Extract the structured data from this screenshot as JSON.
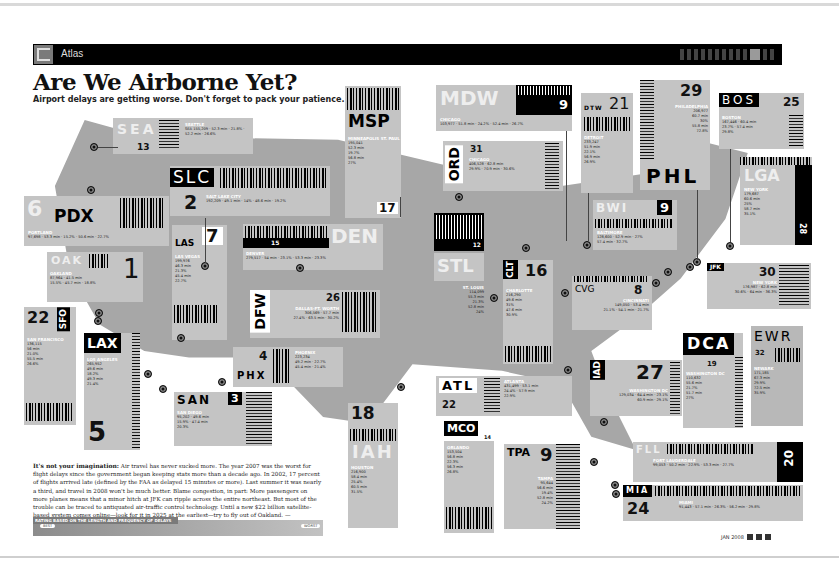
{
  "header": {
    "section": "Atlas",
    "logo_icon": "wired-logo-icon"
  },
  "title": "Are We Airborne Yet?",
  "subtitle": "Airport delays are getting worse. Don't forget to pack your patience.",
  "airports": [
    {
      "code": "SEA",
      "rank": "13",
      "city": "SEATTLE",
      "stats": [
        [
          "DEPARTURES",
          "155,209"
        ],
        [
          "AVG DEPARTURE DELAY",
          "52.3 min"
        ],
        [
          "DEPARTURES DELAYED",
          "21.8%"
        ],
        [
          "AVG ARRIVAL DELAY",
          "52.2 min"
        ],
        [
          "ARRIVALS DELAYED",
          "26.6%"
        ]
      ]
    },
    {
      "code": "PDX",
      "rank": "6",
      "city": "PORTLAND",
      "stats": [
        [
          "DEPARTURES",
          "97,698"
        ],
        [
          "AVG DEPARTURE DELAY",
          "53.3 min"
        ],
        [
          "DEPARTURES DELAYED",
          "15.2%"
        ],
        [
          "AVG ARRIVAL DELAY",
          "50.6 min"
        ],
        [
          "ARRIVALS DELAYED",
          "22.7%"
        ]
      ]
    },
    {
      "code": "SLC",
      "rank": "2",
      "city": "SALT LAKE CITY",
      "stats": [
        [
          "DEPARTURES",
          "192,209"
        ],
        [
          "AVG DEPARTURE DELAY",
          "49.1 min"
        ],
        [
          "DEPARTURES DELAYED",
          "14%"
        ],
        [
          "AVG ARRIVAL DELAY",
          "48.6 min"
        ],
        [
          "ARRIVALS DELAYED",
          "19.2%"
        ]
      ]
    },
    {
      "code": "MSP",
      "rank": "17",
      "city": "MINNEAPOLIS ST. PAUL",
      "stats": [
        [
          "DEPARTURES",
          "195,041"
        ],
        [
          "AVG DEPARTURE DELAY",
          "52.3 min"
        ],
        [
          "DEPARTURES DELAYED",
          "19.7%"
        ],
        [
          "AVG ARRIVAL DELAY",
          "56.8 min"
        ],
        [
          "ARRIVALS DELAYED",
          "27%"
        ]
      ]
    },
    {
      "code": "MDW",
      "rank": "9",
      "city": "CHICAGO",
      "stats": [
        [
          "DEPARTURES",
          "103,977"
        ],
        [
          "AVG DEPARTURE DELAY",
          "51.8 min"
        ],
        [
          "DEPARTURES DELAYED",
          "24.2%"
        ],
        [
          "AVG ARRIVAL DELAY",
          "52.4 min"
        ],
        [
          "ARRIVALS DELAYED",
          "26.7%"
        ]
      ]
    },
    {
      "code": "ORD",
      "rank": "31",
      "city": "CHICAGO",
      "stats": [
        [
          "DEPARTURES",
          "406,528"
        ],
        [
          "AVG DEPARTURE DELAY",
          "62.8 min"
        ],
        [
          "DEPARTURES DELAYED",
          "29.9%"
        ],
        [
          "AVG ARRIVAL DELAY",
          "70.9 min"
        ],
        [
          "ARRIVALS DELAYED",
          "30.6%"
        ]
      ]
    },
    {
      "code": "DTW",
      "rank": "21",
      "city": "DETROIT",
      "stats": [
        [
          "DEPARTURES",
          "233,247"
        ],
        [
          "AVG DEPARTURE DELAY",
          "51.9 min"
        ],
        [
          "DEPARTURES DELAYED",
          "22.1%"
        ],
        [
          "AVG ARRIVAL DELAY",
          "56.9 min"
        ],
        [
          "ARRIVALS DELAYED",
          "26.9%"
        ]
      ]
    },
    {
      "code": "PHL",
      "rank": "29",
      "city": "PHILADELPHIA",
      "stats": [
        [
          "DEPARTURES",
          "206,977"
        ],
        [
          "AVG DEPARTURE DELAY",
          "60.7 min"
        ],
        [
          "DEPARTURES DELAYED",
          "30%"
        ],
        [
          "AVG ARRIVAL DELAY",
          "55.8 min"
        ],
        [
          "ARRIVALS DELAYED",
          "72.8%"
        ]
      ]
    },
    {
      "code": "BOS",
      "rank": "25",
      "city": "BOSTON",
      "stats": [
        [
          "DEPARTURES",
          "167,446"
        ],
        [
          "AVG DEPARTURE DELAY",
          "60.4 min"
        ],
        [
          "DEPARTURES DELAYED",
          "23.7%"
        ],
        [
          "AVG ARRIVAL DELAY",
          "57.4 min"
        ],
        [
          "ARRIVALS DELAYED",
          "29.8%"
        ]
      ]
    },
    {
      "code": "LGA",
      "rank": "28",
      "city": "NEW YORK",
      "stats": [
        [
          "DEPARTURES",
          "179,687"
        ],
        [
          "AVG DEPARTURE DELAY",
          "60.6 min"
        ],
        [
          "DEPARTURES DELAYED",
          "25%"
        ],
        [
          "AVG ARRIVAL DELAY",
          "58.7 min"
        ],
        [
          "ARRIVALS DELAYED",
          "35.1%"
        ]
      ]
    },
    {
      "code": "JFK",
      "rank": "30",
      "city": "NEW YORK",
      "stats": [
        [
          "DEPARTURES",
          "176,987"
        ],
        [
          "AVG DEPARTURE DELAY",
          "62.8 min"
        ],
        [
          "DEPARTURES DELAYED",
          "30.6%"
        ],
        [
          "AVG ARRIVAL DELAY",
          "64 min"
        ],
        [
          "ARRIVALS DELAYED",
          "36.3%"
        ]
      ]
    },
    {
      "code": "EWR",
      "rank": "32",
      "city": "NEWARK",
      "stats": [
        [
          "DEPARTURES",
          "171,185"
        ],
        [
          "AVG DEPARTURE DELAY",
          "67.3 min"
        ],
        [
          "DEPARTURES DELAYED",
          "29.9%"
        ],
        [
          "AVG ARRIVAL DELAY",
          "72.5 min"
        ],
        [
          "ARRIVALS DELAYED",
          "35.9%"
        ]
      ]
    },
    {
      "code": "BWI",
      "rank": "9",
      "city": "BALTIMORE",
      "stats": [
        [
          "DEPARTURES",
          "128,600"
        ],
        [
          "AVG DEPARTURE DELAY",
          "52.9 min"
        ],
        [
          "DEPARTURES DELAYED",
          "27%"
        ],
        [
          "AVG ARRIVAL DELAY",
          "57.4 min"
        ],
        [
          "ARRIVALS DELAYED",
          "32.7%"
        ]
      ]
    },
    {
      "code": "DCA",
      "rank": "19",
      "city": "WASHINGTON DC",
      "stats": [
        [
          "DEPARTURES",
          "110,632"
        ],
        [
          "AVG DEPARTURE DELAY",
          "55.6 min"
        ],
        [
          "DEPARTURES DELAYED",
          "21.7%"
        ],
        [
          "AVG ARRIVAL DELAY",
          "51.7 min"
        ],
        [
          "ARRIVALS DELAYED",
          "27%"
        ]
      ]
    },
    {
      "code": "IAD",
      "rank": "27",
      "city": "WASHINGTON DC",
      "stats": [
        [
          "DEPARTURES",
          "129,034"
        ],
        [
          "AVG DEPARTURE DELAY",
          "64.4 min"
        ],
        [
          "DEPARTURES DELAYED",
          "23.1%"
        ],
        [
          "AVG ARRIVAL DELAY",
          "60.9 min"
        ],
        [
          "ARRIVALS DELAYED",
          "29.1%"
        ]
      ]
    },
    {
      "code": "CVG",
      "rank": "8",
      "city": "CINCINNATI",
      "stats": [
        [
          "DEPARTURES",
          "149,050"
        ],
        [
          "AVG DEPARTURE DELAY",
          "53.4 min"
        ],
        [
          "DEPARTURES DELAYED",
          "21.1%"
        ],
        [
          "AVG ARRIVAL DELAY",
          "54.1 min"
        ],
        [
          "ARRIVALS DELAYED",
          "21.7%"
        ]
      ]
    },
    {
      "code": "CLT",
      "rank": "16",
      "city": "CHARLOTTE",
      "stats": [
        [
          "DEPARTURES",
          "216,290"
        ],
        [
          "AVG DEPARTURE DELAY",
          "49.6 min"
        ],
        [
          "DEPARTURES DELAYED",
          "31%"
        ],
        [
          "AVG ARRIVAL DELAY",
          "47.6 min"
        ],
        [
          "ARRIVALS DELAYED",
          "30.9%"
        ]
      ]
    },
    {
      "code": "STL",
      "rank": "12",
      "city": "ST. LOUIS",
      "stats": [
        [
          "DEPARTURES",
          "114,099"
        ],
        [
          "AVG DEPARTURE DELAY",
          "55.3 min"
        ],
        [
          "DEPARTURES DELAYED",
          "21.3%"
        ],
        [
          "AVG ARRIVAL DELAY",
          "52.8 min"
        ],
        [
          "ARRIVALS DELAYED",
          "24%"
        ]
      ]
    },
    {
      "code": "DEN",
      "rank": "15",
      "city": "DENVER",
      "stats": [
        [
          "DEPARTURES",
          "279,517"
        ],
        [
          "AVG DEPARTURE DELAY",
          "54 min"
        ],
        [
          "DEPARTURES DELAYED",
          "23.1%"
        ],
        [
          "AVG ARRIVAL DELAY",
          "53.3 min"
        ],
        [
          "ARRIVALS DELAYED",
          "23.3%"
        ]
      ]
    },
    {
      "code": "LAS",
      "rank": "7",
      "city": "LAS VEGAS",
      "stats": [
        [
          "DEPARTURES",
          "199,976"
        ],
        [
          "AVG DEPARTURE DELAY",
          "46.3 min"
        ],
        [
          "DEPARTURES DELAYED",
          "21.3%"
        ],
        [
          "AVG ARRIVAL DELAY",
          "45.4 min"
        ],
        [
          "ARRIVALS DELAYED",
          "22.7%"
        ]
      ]
    },
    {
      "code": "OAK",
      "rank": "1",
      "city": "OAKLAND",
      "stats": [
        [
          "DEPARTURES",
          "87,964"
        ],
        [
          "AVG DEPARTURE DELAY",
          "41.5 min"
        ],
        [
          "DEPARTURES DELAYED",
          "15.5%"
        ],
        [
          "AVG ARRIVAL DELAY",
          "45.7 min"
        ],
        [
          "ARRIVALS DELAYED",
          "18.8%"
        ]
      ]
    },
    {
      "code": "SFO",
      "rank": "22",
      "city": "SAN FRANCISCO",
      "stats": [
        [
          "DEPARTURES",
          "136,115"
        ],
        [
          "AVG DEPARTURE DELAY",
          "56 min"
        ],
        [
          "DEPARTURES DELAYED",
          "21.0%"
        ],
        [
          "AVG ARRIVAL DELAY",
          "55.5 min"
        ],
        [
          "ARRIVALS DELAYED",
          "26.6%"
        ]
      ]
    },
    {
      "code": "LAX",
      "rank": "5",
      "city": "LOS ANGELES",
      "stats": [
        [
          "DEPARTURES",
          "265,952"
        ],
        [
          "AVG DEPARTURE DELAY",
          "49.6 min"
        ],
        [
          "DEPARTURES DELAYED",
          "18.2%"
        ],
        [
          "AVG ARRIVAL DELAY",
          "49.3 min"
        ],
        [
          "ARRIVALS DELAYED",
          "21.4%"
        ]
      ]
    },
    {
      "code": "SAN",
      "rank": "3",
      "city": "SAN DIEGO",
      "stats": [
        [
          "DEPARTURES",
          "95,202"
        ],
        [
          "AVG DEPARTURE DELAY",
          "49.6 min"
        ],
        [
          "DEPARTURES DELAYED",
          "15.9%"
        ],
        [
          "AVG ARRIVAL DELAY",
          "47.4 min"
        ],
        [
          "ARRIVALS DELAYED",
          "20.3%"
        ]
      ]
    },
    {
      "code": "PHX",
      "rank": "4",
      "city": "PHOENIX",
      "stats": [
        [
          "DEPARTURES",
          "223,234"
        ],
        [
          "AVG DEPARTURE DELAY",
          "49.2 min"
        ],
        [
          "DEPARTURES DELAYED",
          "22.7%"
        ],
        [
          "AVG ARRIVAL DELAY",
          "45.4 min"
        ],
        [
          "ARRIVALS DELAYED",
          "21.4%"
        ]
      ]
    },
    {
      "code": "DFW",
      "rank": "26",
      "city": "DALLAS-FT. WORTH",
      "stats": [
        [
          "DEPARTURES",
          "306,569"
        ],
        [
          "AVG DEPARTURE DELAY",
          "57.7 min"
        ],
        [
          "DEPARTURES DELAYED",
          "27.4%"
        ],
        [
          "AVG ARRIVAL DELAY",
          "63.5 min"
        ],
        [
          "ARRIVALS DELAYED",
          "30.2%"
        ]
      ]
    },
    {
      "code": "IAH",
      "rank": "18",
      "city": "HOUSTON",
      "stats": [
        [
          "DEPARTURES",
          "216,900"
        ],
        [
          "AVG DEPARTURE DELAY",
          "58.4 min"
        ],
        [
          "DEPARTURES DELAYED",
          "25.4%"
        ],
        [
          "AVG ARRIVAL DELAY",
          "60.5 min"
        ],
        [
          "ARRIVALS DELAYED",
          "31.5%"
        ]
      ]
    },
    {
      "code": "ATL",
      "rank": "22",
      "city": "ATLANTA",
      "stats": [
        [
          "DEPARTURES",
          "431,499"
        ],
        [
          "AVG DEPARTURE DELAY",
          "53.1 min"
        ],
        [
          "DEPARTURES DELAYED",
          "24.4%"
        ],
        [
          "AVG ARRIVAL DELAY",
          "57.9 min"
        ],
        [
          "ARRIVALS DELAYED",
          "22.9%"
        ]
      ]
    },
    {
      "code": "MCO",
      "rank": "14",
      "city": "ORLANDO",
      "stats": [
        [
          "DEPARTURES",
          "153,504"
        ],
        [
          "AVG DEPARTURE DELAY",
          "56.8 min"
        ],
        [
          "DEPARTURES DELAYED",
          "22.3%"
        ],
        [
          "AVG ARRIVAL DELAY",
          "56.3 min"
        ],
        [
          "ARRIVALS DELAYED",
          "26.8%"
        ]
      ]
    },
    {
      "code": "TPA",
      "rank": "9",
      "city": "TAMPA",
      "stats": [
        [
          "DEPARTURES",
          "95,644"
        ],
        [
          "AVG DEPARTURE DELAY",
          "56.6 min"
        ],
        [
          "DEPARTURES DELAYED",
          "19.4%"
        ],
        [
          "AVG ARRIVAL DELAY",
          "52.8 min"
        ],
        [
          "ARRIVALS DELAYED",
          "24.2%"
        ]
      ]
    },
    {
      "code": "FLL",
      "rank": "20",
      "city": "FORT LAUDERDALE",
      "stats": [
        [
          "DEPARTURES",
          "99,053"
        ],
        [
          "AVG DEPARTURE DELAY",
          "50.2 min"
        ],
        [
          "DEPARTURES DELAYED",
          "22.9%"
        ],
        [
          "AVG ARRIVAL DELAY",
          "53.3 min"
        ],
        [
          "ARRIVALS DELAYED",
          "27.7%"
        ]
      ]
    },
    {
      "code": "MIA",
      "rank": "24",
      "city": "MIAMI",
      "stats": [
        [
          "DEPARTURES",
          "91,443"
        ],
        [
          "AVG DEPARTURE DELAY",
          "57.1 min"
        ],
        [
          "DEPARTURES DELAYED",
          "26.3%"
        ],
        [
          "AVG ARRIVAL DELAY",
          "56.2 min"
        ],
        [
          "ARRIVALS DELAYED",
          "29.8%"
        ]
      ]
    }
  ],
  "article": {
    "lead": "It's not your imagination:",
    "body": " Air travel has never sucked more. The year 2007 was the worst for flight delays since the government began keeping stats more than a decade ago. In 2002, 17 percent of flights arrived late (defined by the FAA as delayed 15 minutes or more). Last summer it was nearly a third, and travel in 2008 won't be much better. Blame congestion, in part: More passengers on more planes means that a minor hitch at JFK can ripple across the entire northeast. But most of the trouble can be traced to antiquated air-traffic control technology. Until a new $22 billion satellite-based system comes online—look for it in 2025 at the earliest—try to fly out of Oakland.",
    "byline": "—MATHEW HONAN"
  },
  "rating": {
    "label": "RATING BASED ON THE LENGTH AND FREQUENCY OF DELAYS",
    "best": "BEST",
    "worst": "WORST"
  },
  "footer": {
    "date": "JAN 2008"
  },
  "colors": {
    "map": "#a7a7a7",
    "card": "#c4c4c4",
    "black": "#000000"
  }
}
